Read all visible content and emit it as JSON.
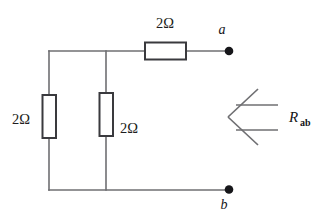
{
  "figure": {
    "name": "resistor-network-rab"
  },
  "components": {
    "top_resistor": {
      "label": "2Ω",
      "orientation": "horizontal"
    },
    "left_resistor": {
      "label": "2Ω",
      "orientation": "vertical"
    },
    "middle_resistor": {
      "label": "2Ω",
      "orientation": "vertical"
    }
  },
  "terminals": {
    "top": {
      "label": "a"
    },
    "bottom": {
      "label": "b"
    }
  },
  "annotation": {
    "resistance_symbol": "R",
    "resistance_subscript": "ab"
  },
  "colors": {
    "wire": "#6f6f72",
    "resistor_outline": "#3a3a3e",
    "node": "#16161a",
    "background": "#ffffff",
    "text": "#1d1d20"
  }
}
